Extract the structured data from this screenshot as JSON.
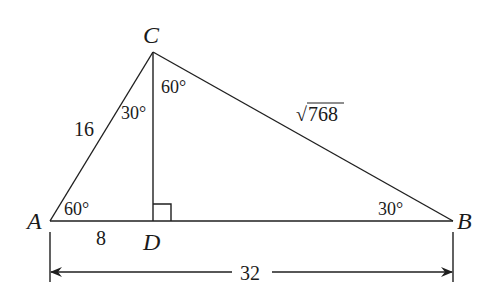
{
  "diagram": {
    "type": "right-triangle-with-altitude",
    "vertices": {
      "A": {
        "label": "A",
        "x": 50,
        "y": 221
      },
      "B": {
        "label": "B",
        "x": 453,
        "y": 221
      },
      "C": {
        "label": "C",
        "x": 153,
        "y": 52
      },
      "D": {
        "label": "D",
        "x": 153,
        "y": 221
      }
    },
    "segments": {
      "AC": {
        "label": "16"
      },
      "CB": {
        "label": "√768",
        "radicand": "768",
        "radical": "√"
      },
      "AD": {
        "label": "8"
      },
      "AB": {
        "label": "32"
      }
    },
    "angles": {
      "A": "60°",
      "B": "30°",
      "ACD": "30°",
      "DCB": "60°"
    },
    "right_angle_at": "D"
  }
}
